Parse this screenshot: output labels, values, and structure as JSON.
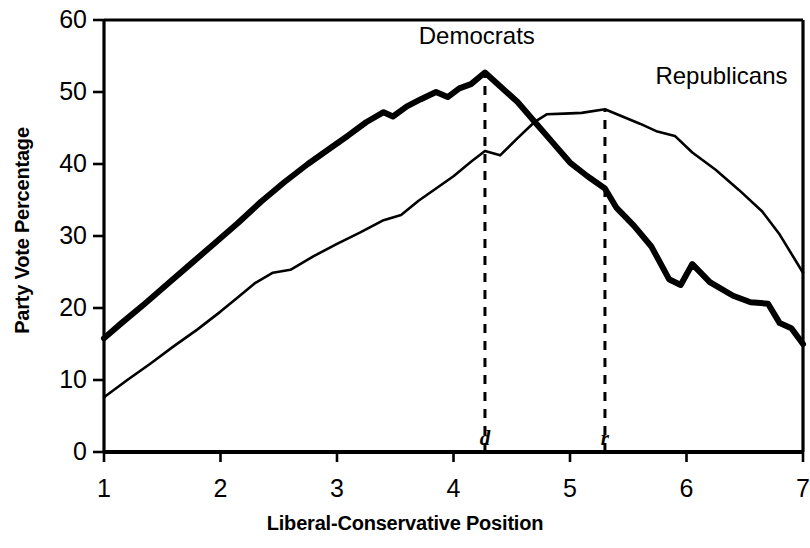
{
  "chart_data": {
    "type": "line",
    "title": "",
    "xlabel": "Liberal-Conservative Position",
    "ylabel": "Party Vote Percentage",
    "xlim": [
      1,
      7
    ],
    "ylim": [
      0,
      60
    ],
    "xticks": [
      "1",
      "2",
      "3",
      "4",
      "5",
      "6",
      "7"
    ],
    "xtick_values": [
      1,
      2,
      3,
      4,
      5,
      6,
      7
    ],
    "yticks": [
      "0",
      "10",
      "20",
      "30",
      "40",
      "50",
      "60"
    ],
    "ytick_values": [
      0,
      10,
      20,
      30,
      40,
      50,
      60
    ],
    "grid": false,
    "legend_position": "inline-annotation",
    "series": [
      {
        "name": "Democrats",
        "style": "thick-solid",
        "color": "#000000",
        "linewidth": 6,
        "x": [
          1.0,
          1.15,
          1.35,
          1.55,
          1.75,
          1.95,
          2.15,
          2.35,
          2.55,
          2.75,
          2.95,
          3.1,
          3.25,
          3.4,
          3.48,
          3.6,
          3.72,
          3.85,
          3.95,
          4.05,
          4.15,
          4.27,
          4.4,
          4.55,
          4.7,
          4.85,
          5.0,
          5.15,
          5.3,
          5.4,
          5.55,
          5.7,
          5.85,
          5.95,
          6.05,
          6.2,
          6.4,
          6.55,
          6.7,
          6.8,
          6.9,
          7.0
        ],
        "y": [
          15.8,
          17.9,
          20.6,
          23.4,
          26.2,
          29.0,
          31.8,
          34.8,
          37.5,
          40.0,
          42.3,
          44.0,
          45.8,
          47.2,
          46.6,
          48.0,
          49.0,
          50.0,
          49.3,
          50.5,
          51.1,
          52.7,
          50.8,
          48.6,
          45.8,
          43.0,
          40.2,
          38.3,
          36.6,
          33.9,
          31.4,
          28.5,
          24.0,
          23.2,
          26.1,
          23.6,
          21.7,
          20.8,
          20.6,
          17.9,
          17.2,
          15.0
        ]
      },
      {
        "name": "Republicans",
        "style": "thin-solid",
        "color": "#000000",
        "linewidth": 2.6,
        "x": [
          1.0,
          1.2,
          1.4,
          1.6,
          1.8,
          2.0,
          2.15,
          2.3,
          2.45,
          2.6,
          2.8,
          3.0,
          3.2,
          3.4,
          3.55,
          3.7,
          3.85,
          4.0,
          4.15,
          4.27,
          4.4,
          4.55,
          4.7,
          4.8,
          4.95,
          5.1,
          5.3,
          5.45,
          5.6,
          5.75,
          5.9,
          6.05,
          6.25,
          6.45,
          6.65,
          6.8,
          7.0
        ],
        "y": [
          7.6,
          10.0,
          12.3,
          14.7,
          17.0,
          19.5,
          21.5,
          23.5,
          24.9,
          25.3,
          27.2,
          28.9,
          30.5,
          32.2,
          32.9,
          34.9,
          36.6,
          38.3,
          40.3,
          41.8,
          41.2,
          43.6,
          45.9,
          46.9,
          47.0,
          47.1,
          47.6,
          46.6,
          45.6,
          44.5,
          43.9,
          41.6,
          39.2,
          36.4,
          33.4,
          30.2,
          24.9
        ]
      }
    ],
    "annotations": [
      {
        "name": "democrats-label",
        "text": "Democrats",
        "x": 4.2,
        "y": 57.5
      },
      {
        "name": "republicans-label",
        "text": "Republicans",
        "x": 6.3,
        "y": 52.0
      }
    ],
    "markers": [
      {
        "name": "d",
        "label": "d",
        "x": 4.27,
        "from_y": 0,
        "to_y": 52.7,
        "style": "dashed"
      },
      {
        "name": "r",
        "label": "r",
        "x": 5.3,
        "from_y": 0,
        "to_y": 47.6,
        "style": "dashed"
      }
    ],
    "axis_color": "#000000",
    "background": "#ffffff"
  }
}
